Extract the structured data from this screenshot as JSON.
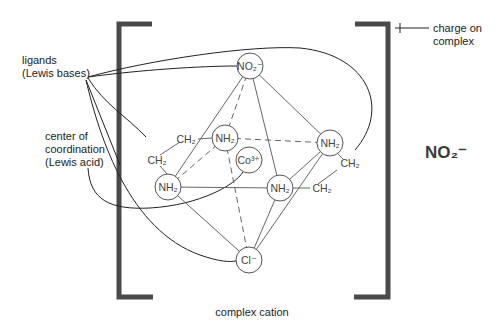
{
  "diagram": {
    "labels": {
      "ligands_line1": "ligands",
      "ligands_line2": "(Lewis bases)",
      "center_line1": "center of",
      "center_line2": "coordination",
      "center_line3": "(Lewis acid)",
      "charge_line1": "charge on",
      "charge_line2": "complex",
      "charge_sign": "+",
      "complex_cation": "complex cation",
      "counter_ion": "NO₂⁻"
    },
    "atoms": [
      {
        "id": "no2",
        "label": "NO₂⁻",
        "x": 250,
        "y": 66
      },
      {
        "id": "nh2_upper_left",
        "label": "NH₂",
        "x": 225,
        "y": 138
      },
      {
        "id": "nh2_right",
        "label": "NH₂",
        "x": 330,
        "y": 143
      },
      {
        "id": "co",
        "label": "Co³⁺",
        "x": 249,
        "y": 160
      },
      {
        "id": "nh2_left",
        "label": "NH₂",
        "x": 168,
        "y": 187
      },
      {
        "id": "nh2_center",
        "label": "NH₂",
        "x": 280,
        "y": 188
      },
      {
        "id": "cl",
        "label": "Cl⁻",
        "x": 249,
        "y": 260
      }
    ],
    "ch2_groups": [
      {
        "label": "CH₂",
        "x": 174,
        "y": 142
      },
      {
        "label": "CH₂",
        "x": 146,
        "y": 163
      },
      {
        "label": "CH₂",
        "x": 338,
        "y": 167
      },
      {
        "label": "CH₂",
        "x": 310,
        "y": 193
      }
    ]
  }
}
